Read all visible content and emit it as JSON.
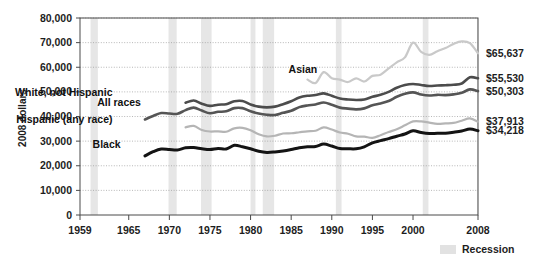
{
  "chart_data": {
    "type": "line",
    "title": "",
    "subtitle": "",
    "xlabel": "",
    "ylabel": "2008 dollars",
    "xlim": [
      1959,
      2008
    ],
    "ylim": [
      0,
      80000
    ],
    "grid": true,
    "legend_position": "bottom-right",
    "y_ticks": [
      "0",
      "10,000",
      "20,000",
      "30,000",
      "40,000",
      "50,000",
      "60,000",
      "70,000",
      "80,000"
    ],
    "y_tick_values": [
      0,
      10000,
      20000,
      30000,
      40000,
      50000,
      60000,
      70000,
      80000
    ],
    "x_ticks": [
      "1959",
      "1965",
      "1970",
      "1975",
      "1980",
      "1985",
      "1990",
      "1995",
      "2000",
      "2008"
    ],
    "x_tick_values": [
      1959,
      1965,
      1970,
      1975,
      1980,
      1985,
      1990,
      1995,
      2000,
      2008
    ],
    "legend": [
      {
        "label": "Recession",
        "color": "#e2e2e2",
        "type": "band"
      }
    ],
    "recessions": [
      {
        "start": 1960.3,
        "end": 1961.2
      },
      {
        "start": 1969.9,
        "end": 1970.9
      },
      {
        "start": 1973.9,
        "end": 1975.2
      },
      {
        "start": 1980.0,
        "end": 1980.6
      },
      {
        "start": 1981.5,
        "end": 1982.9
      },
      {
        "start": 1990.5,
        "end": 1991.2
      },
      {
        "start": 2001.2,
        "end": 2001.9
      },
      {
        "start": 2007.9,
        "end": 2008.5
      }
    ],
    "series": [
      {
        "name": "Asian",
        "label": "Asian",
        "color": "#c9c9c9",
        "width": 2.2,
        "label_x": 1988.2,
        "label_y": 57600,
        "end_value": 65637,
        "end_label": "$65,637",
        "x": [
          1987,
          1988,
          1989,
          1990,
          1991,
          1992,
          1993,
          1994,
          1995,
          1996,
          1997,
          1998,
          1999,
          2000,
          2001,
          2002,
          2003,
          2004,
          2005,
          2006,
          2007,
          2008
        ],
        "values": [
          55000,
          53600,
          58000,
          55500,
          55000,
          54000,
          55500,
          54200,
          56500,
          57000,
          59500,
          62000,
          64000,
          70000,
          66200,
          65000,
          66500,
          67800,
          69500,
          70500,
          69800,
          65637
        ]
      },
      {
        "name": "White, not Hispanic",
        "label": "White, not Hispanic",
        "color": "#4c4c4c",
        "width": 2.6,
        "label_x": 1963.0,
        "label_y": 48300,
        "end_value": 55530,
        "end_label": "$55,530",
        "x": [
          1972,
          1973,
          1974,
          1975,
          1976,
          1977,
          1978,
          1979,
          1980,
          1981,
          1982,
          1983,
          1984,
          1985,
          1986,
          1987,
          1988,
          1989,
          1990,
          1991,
          1992,
          1993,
          1994,
          1995,
          1996,
          1997,
          1998,
          1999,
          2000,
          2001,
          2002,
          2003,
          2004,
          2005,
          2006,
          2007,
          2008
        ],
        "values": [
          45600,
          46500,
          45200,
          44300,
          44800,
          45000,
          46200,
          46300,
          44900,
          44000,
          43700,
          44000,
          45000,
          46200,
          47700,
          48400,
          48700,
          49400,
          48400,
          47300,
          46900,
          46700,
          46900,
          48000,
          48800,
          50000,
          51700,
          52800,
          53200,
          52800,
          52400,
          52600,
          52700,
          52900,
          53400,
          55900,
          55530
        ]
      },
      {
        "name": "All races",
        "label": "All races",
        "color": "#555555",
        "width": 2.6,
        "label_x": 1966.5,
        "label_y": 44200,
        "end_value": 50303,
        "end_label": "$50,303",
        "x": [
          1967,
          1968,
          1969,
          1970,
          1971,
          1972,
          1973,
          1974,
          1975,
          1976,
          1977,
          1978,
          1979,
          1980,
          1981,
          1982,
          1983,
          1984,
          1985,
          1986,
          1987,
          1988,
          1989,
          1990,
          1991,
          1992,
          1993,
          1994,
          1995,
          1996,
          1997,
          1998,
          1999,
          2000,
          2001,
          2002,
          2003,
          2004,
          2005,
          2006,
          2007,
          2008
        ],
        "values": [
          38800,
          40200,
          41400,
          41200,
          41100,
          42600,
          43600,
          42400,
          41300,
          41900,
          42100,
          43400,
          43400,
          42100,
          41200,
          40700,
          40600,
          41500,
          42300,
          43800,
          44500,
          44900,
          45700,
          44800,
          43600,
          43200,
          42900,
          43300,
          44600,
          45300,
          46300,
          48000,
          49200,
          49800,
          48900,
          48500,
          48800,
          48700,
          49000,
          49600,
          51000,
          50303
        ]
      },
      {
        "name": "Hispanic (any race)",
        "label": "Hispanic (any race)",
        "color": "#b5b5b5",
        "width": 2.2,
        "label_x": 1963.0,
        "label_y": 37300,
        "end_value": 37913,
        "end_label": "$37,913",
        "x": [
          1972,
          1973,
          1974,
          1975,
          1976,
          1977,
          1978,
          1979,
          1980,
          1981,
          1982,
          1983,
          1984,
          1985,
          1986,
          1987,
          1988,
          1989,
          1990,
          1991,
          1992,
          1993,
          1994,
          1995,
          1996,
          1997,
          1998,
          1999,
          2000,
          2001,
          2002,
          2003,
          2004,
          2005,
          2006,
          2007,
          2008
        ],
        "values": [
          35600,
          36200,
          34500,
          33900,
          34000,
          33800,
          35200,
          35400,
          34400,
          32800,
          31900,
          32200,
          33100,
          33200,
          33600,
          34000,
          34200,
          35600,
          34700,
          33500,
          33000,
          31900,
          31800,
          31300,
          32400,
          33700,
          34800,
          36400,
          38000,
          38000,
          37500,
          37000,
          37200,
          37400,
          38300,
          39200,
          37913
        ]
      },
      {
        "name": "Black",
        "label": "Black",
        "color": "#141414",
        "width": 3.0,
        "label_x": 1964.0,
        "label_y": 27100,
        "end_value": 34218,
        "end_label": "$34,218",
        "x": [
          1967,
          1968,
          1969,
          1970,
          1971,
          1972,
          1973,
          1974,
          1975,
          1976,
          1977,
          1978,
          1979,
          1980,
          1981,
          1982,
          1983,
          1984,
          1985,
          1986,
          1987,
          1988,
          1989,
          1990,
          1991,
          1992,
          1993,
          1994,
          1995,
          1996,
          1997,
          1998,
          1999,
          2000,
          2001,
          2002,
          2003,
          2004,
          2005,
          2006,
          2007,
          2008
        ],
        "values": [
          24000,
          25700,
          26800,
          26600,
          26400,
          27300,
          27400,
          26900,
          26600,
          27000,
          26800,
          28300,
          27700,
          26900,
          25900,
          25400,
          25600,
          26000,
          26600,
          27300,
          27700,
          27800,
          28800,
          28000,
          27000,
          26900,
          26900,
          27700,
          29300,
          30200,
          31000,
          32000,
          32900,
          34200,
          33500,
          33100,
          33200,
          33200,
          33600,
          34100,
          34900,
          34218
        ]
      }
    ]
  },
  "legend": {
    "recession_label": "Recession"
  },
  "axis": {
    "y_title": "2008 dollars"
  }
}
